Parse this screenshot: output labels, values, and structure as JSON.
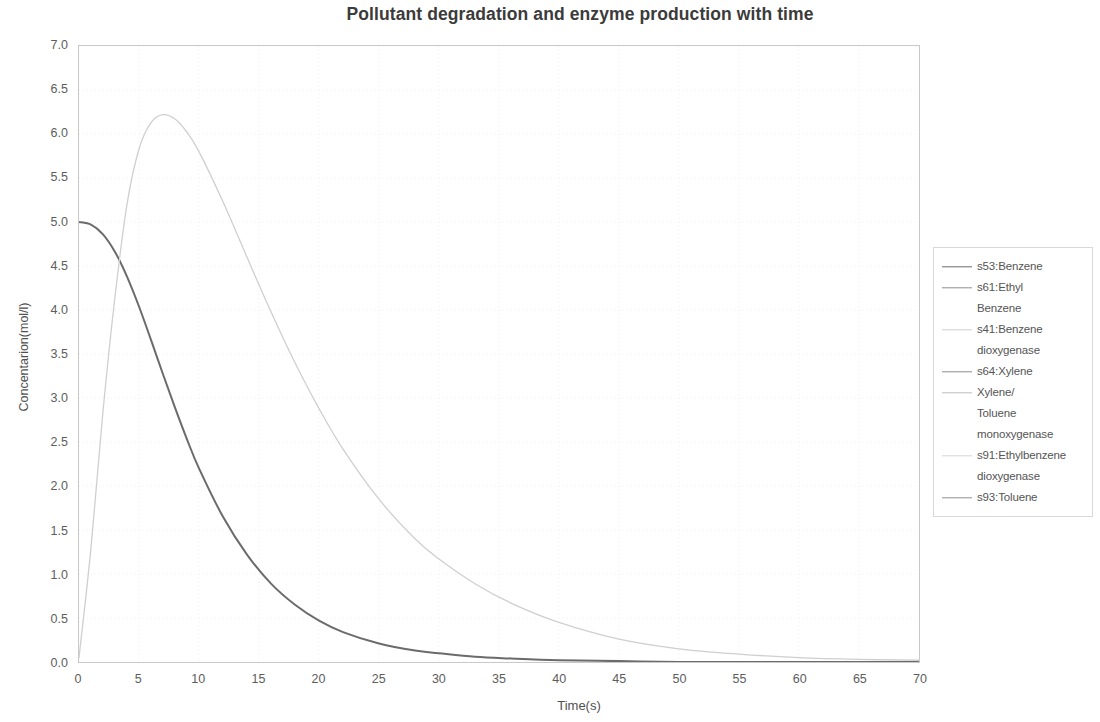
{
  "chart_data": {
    "type": "line",
    "title": "Pollutant degradation and enzyme production with time",
    "xlabel": "Time(s)",
    "ylabel": "Concentarion(mol/l)",
    "xlim": [
      0,
      70
    ],
    "ylim": [
      0.0,
      7.0
    ],
    "xticks": [
      "0",
      "5",
      "10",
      "15",
      "20",
      "25",
      "30",
      "35",
      "40",
      "45",
      "50",
      "55",
      "60",
      "65",
      "70"
    ],
    "yticks": [
      "0.0",
      "0.5",
      "1.0",
      "1.5",
      "2.0",
      "2.5",
      "3.0",
      "3.5",
      "4.0",
      "4.5",
      "5.0",
      "5.5",
      "6.0",
      "6.5",
      "7.0"
    ],
    "grid": true,
    "legend_position": "right",
    "x": [
      0,
      1,
      2,
      3,
      4,
      5,
      6,
      7,
      8,
      9,
      10,
      12,
      14,
      16,
      18,
      20,
      22,
      25,
      28,
      30,
      33,
      36,
      40,
      45,
      50,
      55,
      60,
      65,
      70
    ],
    "series": [
      {
        "name": "s53:Benzene",
        "color": "#6b6b6b",
        "visible": true,
        "values": [
          5.0,
          4.97,
          4.86,
          4.66,
          4.38,
          4.04,
          3.66,
          3.27,
          2.89,
          2.53,
          2.2,
          1.65,
          1.22,
          0.89,
          0.65,
          0.47,
          0.34,
          0.21,
          0.13,
          0.1,
          0.06,
          0.04,
          0.02,
          0.01,
          0.0,
          0.0,
          0.0,
          0.0,
          0.0
        ]
      },
      {
        "name": "s61:Ethyl Benzene",
        "color": "#9a9a9a",
        "visible": false,
        "values": [
          0,
          0,
          0,
          0,
          0,
          0,
          0,
          0,
          0,
          0,
          0,
          0,
          0,
          0,
          0,
          0,
          0,
          0,
          0,
          0,
          0,
          0,
          0,
          0,
          0,
          0,
          0,
          0,
          0
        ]
      },
      {
        "name": "s41:Benzene dioxygenase",
        "color": "#cfcfcf",
        "visible": true,
        "values": [
          0.05,
          1.3,
          2.85,
          4.15,
          5.2,
          5.83,
          6.13,
          6.22,
          6.17,
          6.02,
          5.8,
          5.23,
          4.6,
          3.98,
          3.4,
          2.88,
          2.42,
          1.85,
          1.4,
          1.17,
          0.89,
          0.67,
          0.45,
          0.26,
          0.15,
          0.09,
          0.05,
          0.03,
          0.02
        ]
      },
      {
        "name": "s64:Xylene",
        "color": "#8e8e8e",
        "visible": false,
        "values": [
          0,
          0,
          0,
          0,
          0,
          0,
          0,
          0,
          0,
          0,
          0,
          0,
          0,
          0,
          0,
          0,
          0,
          0,
          0,
          0,
          0,
          0,
          0,
          0,
          0,
          0,
          0,
          0,
          0
        ]
      },
      {
        "name": "Xylene/ Toluene monoxygenase",
        "color": "#bdbdbd",
        "visible": false,
        "values": [
          0,
          0,
          0,
          0,
          0,
          0,
          0,
          0,
          0,
          0,
          0,
          0,
          0,
          0,
          0,
          0,
          0,
          0,
          0,
          0,
          0,
          0,
          0,
          0,
          0,
          0,
          0,
          0,
          0
        ]
      },
      {
        "name": "s91:Ethylbenzene dioxygenase",
        "color": "#d4d4d4",
        "visible": false,
        "values": [
          0,
          0,
          0,
          0,
          0,
          0,
          0,
          0,
          0,
          0,
          0,
          0,
          0,
          0,
          0,
          0,
          0,
          0,
          0,
          0,
          0,
          0,
          0,
          0,
          0,
          0,
          0,
          0,
          0
        ]
      },
      {
        "name": "s93:Toluene",
        "color": "#909090",
        "visible": false,
        "values": [
          0,
          0,
          0,
          0,
          0,
          0,
          0,
          0,
          0,
          0,
          0,
          0,
          0,
          0,
          0,
          0,
          0,
          0,
          0,
          0,
          0,
          0,
          0,
          0,
          0,
          0,
          0,
          0,
          0
        ]
      }
    ],
    "annotations": {
      "peak_label": "6.2 at t≈7.3"
    }
  },
  "legend": {
    "entries": [
      {
        "line1": "s53:Benzene",
        "line2": null,
        "line3": null,
        "color": "#6b6b6b"
      },
      {
        "line1": "s61:Ethyl",
        "line2": "Benzene",
        "line3": null,
        "color": "#8f8f8f"
      },
      {
        "line1": "s41:Benzene",
        "line2": "dioxygenase",
        "line3": null,
        "color": "#cfcfcf"
      },
      {
        "line1": "s64:Xylene",
        "line2": null,
        "line3": null,
        "color": "#8e8e8e"
      },
      {
        "line1": "Xylene/",
        "line2": "Toluene",
        "line3": "monoxygenase",
        "color": "#bdbdbd"
      },
      {
        "line1": "s91:Ethylbenzene",
        "line2": "dioxygenase",
        "line3": null,
        "color": "#d4d4d4"
      },
      {
        "line1": "s93:Toluene",
        "line2": null,
        "line3": null,
        "color": "#909090"
      }
    ]
  }
}
